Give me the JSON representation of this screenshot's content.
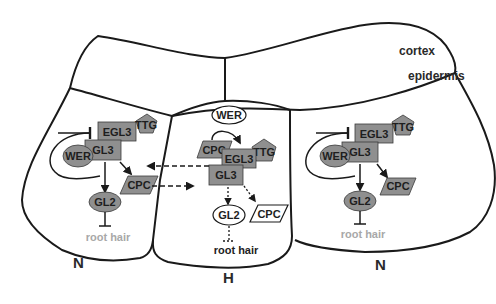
{
  "labels": {
    "cortex": "cortex",
    "epidermis": "epidermis",
    "left_cell_type": "N",
    "center_cell_type": "H",
    "right_cell_type": "N"
  },
  "left_cell": {
    "nodes": {
      "egl3": "EGL3",
      "ttg": "TTG",
      "gl3": "GL3",
      "wer": "WER",
      "cpc": "CPC",
      "gl2": "GL2",
      "root_hair": "root hair"
    }
  },
  "center_cell": {
    "nodes": {
      "wer": "WER",
      "cpc": "CPC",
      "egl3": "EGL3",
      "ttg": "TTG",
      "gl3": "GL3",
      "gl2": "GL2",
      "cpc_out": "CPC",
      "root_hair": "root hair"
    }
  },
  "right_cell": {
    "nodes": {
      "egl3": "EGL3",
      "ttg": "TTG",
      "gl3": "GL3",
      "wer": "WER",
      "cpc": "CPC",
      "gl2": "GL2",
      "root_hair": "root hair"
    }
  },
  "colors": {
    "active_node": "#8f8f8f",
    "inactive_node": "#ffffff",
    "outline": "#1a1a1a",
    "suppressed_text": "#a8a8a8"
  }
}
